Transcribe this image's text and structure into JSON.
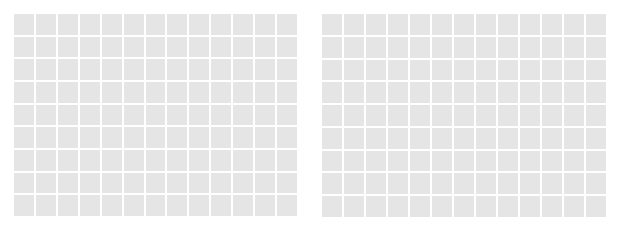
{
  "grids": [
    {
      "id": "left",
      "columns": 13,
      "rows": 9,
      "cell_color": "#e5e5e5",
      "gap_color": "#ffffff"
    },
    {
      "id": "right",
      "columns": 13,
      "rows": 9,
      "cell_color": "#e5e5e5",
      "gap_color": "#ffffff"
    }
  ],
  "background_color": "#ffffff"
}
